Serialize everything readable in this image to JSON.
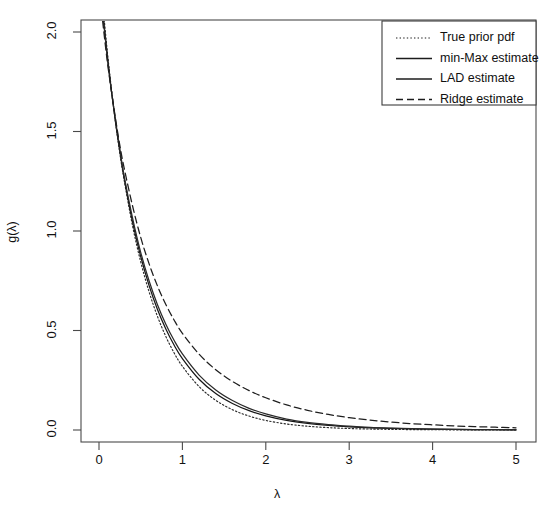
{
  "title_cut": "",
  "axes": {
    "xlabel": "λ",
    "ylabel": "g(λ)",
    "xticks": [
      "0",
      "1",
      "2",
      "3",
      "4",
      "5"
    ],
    "yticks": [
      "0.0",
      "0.5",
      "1.0",
      "1.5",
      "2.0"
    ]
  },
  "legend": {
    "items": [
      {
        "label": "True prior pdf",
        "style": "dotted"
      },
      {
        "label": "min-Max estimate",
        "style": "solid"
      },
      {
        "label": "LAD estimate",
        "style": "solid"
      },
      {
        "label": "Ridge estimate",
        "style": "dashed"
      }
    ]
  },
  "chart_data": {
    "type": "line",
    "title": "",
    "xlabel": "λ",
    "ylabel": "g(λ)",
    "xlim": [
      0,
      5
    ],
    "ylim": [
      0.0,
      2.1
    ],
    "grid": false,
    "legend_position": "top-right",
    "x": [
      0.0,
      0.05,
      0.1,
      0.15,
      0.2,
      0.25,
      0.3,
      0.4,
      0.5,
      0.6,
      0.7,
      0.8,
      0.9,
      1.0,
      1.2,
      1.4,
      1.6,
      1.8,
      2.0,
      2.25,
      2.5,
      2.75,
      3.0,
      3.25,
      3.5,
      3.75,
      4.0,
      4.25,
      4.5,
      4.75,
      5.0
    ],
    "series": [
      {
        "name": "True prior pdf",
        "style": "dotted",
        "color": "#2b2b2b",
        "values": [
          2.35,
          2.12,
          1.9,
          1.71,
          1.54,
          1.39,
          1.26,
          1.03,
          0.845,
          0.695,
          0.572,
          0.471,
          0.388,
          0.32,
          0.218,
          0.149,
          0.102,
          0.07,
          0.048,
          0.03,
          0.019,
          0.012,
          0.0075,
          0.0048,
          0.0031,
          0.002,
          0.0013,
          0.0009,
          0.0006,
          0.0004,
          0.0003
        ]
      },
      {
        "name": "min-Max estimate",
        "style": "solid",
        "color": "#161616",
        "values": [
          2.3,
          2.08,
          1.88,
          1.7,
          1.54,
          1.4,
          1.27,
          1.05,
          0.872,
          0.727,
          0.607,
          0.509,
          0.427,
          0.359,
          0.255,
          0.183,
          0.133,
          0.097,
          0.071,
          0.048,
          0.033,
          0.023,
          0.016,
          0.011,
          0.0077,
          0.0054,
          0.0038,
          0.0027,
          0.0019,
          0.0013,
          0.0009
        ]
      },
      {
        "name": "LAD estimate",
        "style": "solid",
        "color": "#2a2a2a",
        "values": [
          2.28,
          2.07,
          1.87,
          1.7,
          1.55,
          1.41,
          1.28,
          1.07,
          0.893,
          0.75,
          0.631,
          0.533,
          0.451,
          0.382,
          0.276,
          0.201,
          0.148,
          0.109,
          0.081,
          0.055,
          0.038,
          0.027,
          0.019,
          0.013,
          0.0092,
          0.0065,
          0.0046,
          0.0033,
          0.0023,
          0.0016,
          0.0012
        ]
      },
      {
        "name": "Ridge estimate",
        "style": "dashed",
        "color": "#1e1e1e",
        "values": [
          2.22,
          2.03,
          1.85,
          1.7,
          1.56,
          1.43,
          1.32,
          1.13,
          0.968,
          0.836,
          0.725,
          0.632,
          0.553,
          0.486,
          0.381,
          0.303,
          0.244,
          0.198,
          0.162,
          0.126,
          0.099,
          0.078,
          0.062,
          0.05,
          0.04,
          0.032,
          0.026,
          0.021,
          0.017,
          0.014,
          0.011
        ]
      }
    ]
  }
}
